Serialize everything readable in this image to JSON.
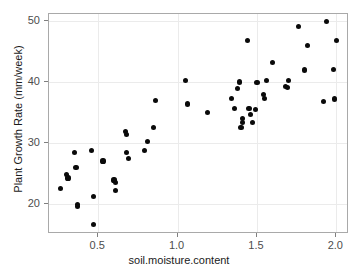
{
  "chart_data": {
    "type": "scatter",
    "title": "",
    "xlabel": "soil.moisture.content",
    "ylabel": "Plant Growth Rate (mm/week)",
    "xlim": [
      0.19,
      2.08
    ],
    "ylim": [
      15.0,
      51.2
    ],
    "xticks": [
      0.5,
      1.0,
      1.5,
      2.0
    ],
    "xticklabels": [
      "0.5",
      "1.0",
      "1.5",
      "2.0"
    ],
    "yticks": [
      20,
      30,
      40,
      50
    ],
    "yticklabels": [
      "20",
      "30",
      "40",
      "50"
    ],
    "grid": true,
    "legend": "none",
    "point_color": "#0a0a0a",
    "panel_background": "#ffffff",
    "gridline_color": "#ebebeb",
    "panel_border_color": "#a9a9a9",
    "x": [
      0.26,
      0.3,
      0.31,
      0.35,
      0.36,
      0.37,
      0.37,
      0.46,
      0.47,
      0.47,
      0.53,
      0.6,
      0.61,
      0.61,
      0.67,
      0.68,
      0.68,
      0.69,
      0.79,
      0.81,
      0.85,
      0.86,
      1.05,
      1.06,
      1.19,
      1.34,
      1.36,
      1.38,
      1.39,
      1.4,
      1.41,
      1.41,
      1.44,
      1.45,
      1.46,
      1.47,
      1.49,
      1.5,
      1.54,
      1.55,
      1.56,
      1.6,
      1.68,
      1.69,
      1.7,
      1.76,
      1.8,
      1.82,
      1.92,
      1.94,
      1.98,
      1.99,
      2.0
    ],
    "y": [
      22.5,
      24.8,
      24.2,
      28.4,
      26.0,
      19.9,
      19.5,
      28.8,
      21.2,
      16.5,
      27.0,
      23.9,
      23.5,
      22.2,
      31.9,
      31.4,
      28.4,
      27.4,
      28.8,
      30.2,
      32.5,
      37.0,
      40.3,
      36.4,
      35.0,
      37.3,
      35.6,
      38.9,
      40.0,
      32.5,
      33.3,
      34.0,
      46.9,
      35.6,
      34.6,
      33.4,
      35.5,
      39.9,
      37.9,
      37.3,
      40.2,
      43.2,
      39.3,
      39.1,
      40.2,
      49.1,
      42.0,
      46.0,
      36.8,
      49.9,
      42.1,
      37.2,
      46.9
    ]
  }
}
